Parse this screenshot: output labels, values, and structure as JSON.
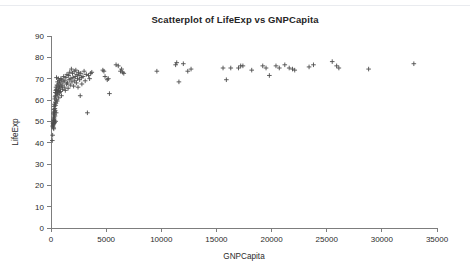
{
  "chart_data": {
    "type": "scatter",
    "title": "Scatterplot of LifeExp vs GNPCapita",
    "xlabel": "GNPCapita",
    "ylabel": "LifeExp",
    "xlim": [
      0,
      35000
    ],
    "ylim": [
      0,
      90
    ],
    "xticks": [
      0,
      5000,
      10000,
      15000,
      20000,
      25000,
      30000,
      35000
    ],
    "yticks": [
      0,
      10,
      20,
      30,
      40,
      50,
      60,
      70,
      80,
      90
    ],
    "xtick_labels": [
      "0",
      "5000",
      "10000",
      "15000",
      "20000",
      "25000",
      "30000",
      "35000"
    ],
    "ytick_labels": [
      "0",
      "10",
      "20",
      "30",
      "40",
      "50",
      "60",
      "70",
      "80",
      "90"
    ],
    "grid": false,
    "legend": false,
    "marker": "plus-cross",
    "marker_color": "#4d4d4d",
    "series": [
      {
        "name": "LifeExp vs GNPCapita",
        "points": [
          [
            120,
            41.0
          ],
          [
            150,
            43.5
          ],
          [
            170,
            47.5
          ],
          [
            180,
            48.0
          ],
          [
            190,
            49.0
          ],
          [
            200,
            49.5
          ],
          [
            210,
            50.5
          ],
          [
            215,
            48.5
          ],
          [
            220,
            47.0
          ],
          [
            230,
            51.0
          ],
          [
            235,
            53.5
          ],
          [
            240,
            50.0
          ],
          [
            250,
            46.5
          ],
          [
            255,
            52.0
          ],
          [
            260,
            54.0
          ],
          [
            270,
            49.0
          ],
          [
            275,
            55.5
          ],
          [
            280,
            51.5
          ],
          [
            290,
            57.0
          ],
          [
            300,
            50.5
          ],
          [
            305,
            53.0
          ],
          [
            310,
            58.0
          ],
          [
            320,
            54.5
          ],
          [
            330,
            49.5
          ],
          [
            340,
            60.5
          ],
          [
            350,
            56.0
          ],
          [
            360,
            52.5
          ],
          [
            370,
            61.5
          ],
          [
            380,
            55.0
          ],
          [
            390,
            59.0
          ],
          [
            400,
            63.5
          ],
          [
            410,
            57.5
          ],
          [
            420,
            50.0
          ],
          [
            430,
            62.0
          ],
          [
            440,
            64.5
          ],
          [
            450,
            58.5
          ],
          [
            460,
            66.0
          ],
          [
            470,
            54.0
          ],
          [
            480,
            60.0
          ],
          [
            490,
            65.0
          ],
          [
            500,
            70.5
          ],
          [
            520,
            63.0
          ],
          [
            540,
            67.0
          ],
          [
            560,
            59.5
          ],
          [
            580,
            64.0
          ],
          [
            600,
            68.5
          ],
          [
            620,
            62.5
          ],
          [
            640,
            66.5
          ],
          [
            660,
            70.0
          ],
          [
            680,
            64.5
          ],
          [
            700,
            61.0
          ],
          [
            720,
            67.5
          ],
          [
            740,
            65.5
          ],
          [
            760,
            69.0
          ],
          [
            780,
            63.5
          ],
          [
            800,
            66.0
          ],
          [
            830,
            68.0
          ],
          [
            860,
            64.0
          ],
          [
            890,
            70.0
          ],
          [
            920,
            66.5
          ],
          [
            950,
            62.0
          ],
          [
            980,
            69.5
          ],
          [
            1010,
            67.0
          ],
          [
            1050,
            65.0
          ],
          [
            1100,
            68.5
          ],
          [
            1150,
            71.0
          ],
          [
            1200,
            66.0
          ],
          [
            1250,
            69.0
          ],
          [
            1300,
            64.5
          ],
          [
            1350,
            70.5
          ],
          [
            1400,
            67.5
          ],
          [
            1450,
            72.0
          ],
          [
            1500,
            68.0
          ],
          [
            1550,
            65.5
          ],
          [
            1600,
            71.5
          ],
          [
            1650,
            69.5
          ],
          [
            1700,
            73.0
          ],
          [
            1750,
            67.0
          ],
          [
            1800,
            70.0
          ],
          [
            1850,
            74.5
          ],
          [
            1900,
            68.5
          ],
          [
            1950,
            72.5
          ],
          [
            2000,
            70.5
          ],
          [
            2050,
            66.5
          ],
          [
            2100,
            73.5
          ],
          [
            2150,
            69.0
          ],
          [
            2200,
            71.0
          ],
          [
            2250,
            74.0
          ],
          [
            2300,
            68.0
          ],
          [
            2350,
            72.0
          ],
          [
            2400,
            70.0
          ],
          [
            2450,
            66.0
          ],
          [
            2500,
            73.0
          ],
          [
            2550,
            71.5
          ],
          [
            2600,
            69.5
          ],
          [
            2650,
            62.0
          ],
          [
            2700,
            72.5
          ],
          [
            2750,
            70.5
          ],
          [
            2800,
            67.5
          ],
          [
            2900,
            71.0
          ],
          [
            3000,
            73.5
          ],
          [
            3100,
            69.0
          ],
          [
            3200,
            72.0
          ],
          [
            3300,
            54.0
          ],
          [
            3400,
            71.5
          ],
          [
            3500,
            70.0
          ],
          [
            3600,
            72.5
          ],
          [
            3700,
            73.0
          ],
          [
            4700,
            74.0
          ],
          [
            4800,
            73.5
          ],
          [
            4900,
            71.0
          ],
          [
            5100,
            69.5
          ],
          [
            5200,
            70.0
          ],
          [
            5300,
            63.0
          ],
          [
            5900,
            76.5
          ],
          [
            6100,
            76.0
          ],
          [
            6300,
            73.5
          ],
          [
            6400,
            74.5
          ],
          [
            6500,
            73.0
          ],
          [
            6600,
            72.5
          ],
          [
            9600,
            73.5
          ],
          [
            11300,
            76.5
          ],
          [
            11400,
            77.5
          ],
          [
            11600,
            68.5
          ],
          [
            12000,
            77.0
          ],
          [
            12400,
            73.5
          ],
          [
            12700,
            74.5
          ],
          [
            15600,
            75.0
          ],
          [
            15900,
            69.5
          ],
          [
            16300,
            75.0
          ],
          [
            17000,
            75.0
          ],
          [
            17200,
            76.0
          ],
          [
            17400,
            76.0
          ],
          [
            18200,
            74.0
          ],
          [
            19200,
            76.0
          ],
          [
            19500,
            75.0
          ],
          [
            19800,
            71.5
          ],
          [
            20400,
            76.0
          ],
          [
            20700,
            75.0
          ],
          [
            21200,
            76.5
          ],
          [
            21600,
            75.0
          ],
          [
            21900,
            74.5
          ],
          [
            22100,
            74.0
          ],
          [
            23400,
            75.5
          ],
          [
            23800,
            76.5
          ],
          [
            25500,
            78.0
          ],
          [
            25900,
            76.0
          ],
          [
            26100,
            75.0
          ],
          [
            28800,
            74.5
          ],
          [
            32900,
            77.0
          ]
        ]
      }
    ]
  }
}
